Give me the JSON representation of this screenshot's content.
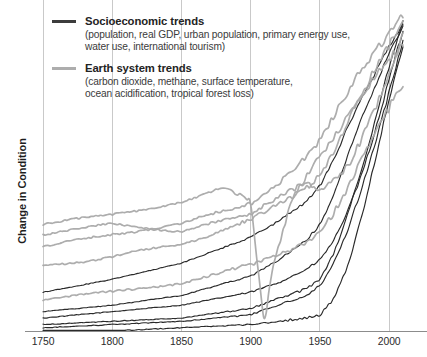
{
  "figure": {
    "title": "",
    "y_axis_label": "Change in Condition"
  },
  "legend": {
    "position": "top-left",
    "entries": [
      {
        "label": "Socioeconomic trends",
        "detail_line1": "(population, real GDP, urban population, primary energy use,",
        "detail_line2": "water use, international tourism)",
        "color": "#3c3c3c",
        "swatch_name": "socioeconomic-line-swatch"
      },
      {
        "label": "Earth system trends",
        "detail_line1": "(carbon dioxide, methane, surface temperature,",
        "detail_line2": "ocean acidification, tropical forest loss)",
        "color": "#adadad",
        "swatch_name": "earth-system-line-swatch"
      }
    ]
  },
  "axis": {
    "x_ticks": [
      "1750",
      "1800",
      "1850",
      "1900",
      "1950",
      "2000"
    ]
  },
  "colors": {
    "socioeconomic": "#2a2a2a",
    "earth_system": "#a9a9a9",
    "gridline": "#c9c9c9",
    "axis": "#8c8c8c",
    "background": "#ffffff"
  },
  "chart_data": {
    "type": "line",
    "title": "",
    "subtitle": "",
    "xlabel": "",
    "ylabel": "Change in Condition",
    "xlim": [
      1750,
      2010
    ],
    "ylim": [
      0,
      1
    ],
    "xticks": [
      1750,
      1800,
      1850,
      1900,
      1950,
      2000
    ],
    "yticks": [],
    "grid": "vertical-only",
    "legend_position": "top-left",
    "note": "The Great Acceleration: normalized indicators rising sharply after 1950. Y axis is unitless relative change; values are normalized 0-1 of plotted height.",
    "series": [
      {
        "name": "population",
        "group": "Socioeconomic trends",
        "color": "#2a2a2a",
        "x": [
          1750,
          1800,
          1850,
          1900,
          1920,
          1940,
          1950,
          1960,
          1970,
          1980,
          1990,
          2000,
          2010
        ],
        "values": [
          0.04,
          0.06,
          0.08,
          0.12,
          0.15,
          0.19,
          0.22,
          0.28,
          0.37,
          0.48,
          0.62,
          0.78,
          0.93
        ]
      },
      {
        "name": "real GDP",
        "group": "Socioeconomic trends",
        "color": "#2a2a2a",
        "x": [
          1750,
          1800,
          1850,
          1900,
          1920,
          1940,
          1950,
          1960,
          1970,
          1980,
          1990,
          2000,
          2010
        ],
        "values": [
          0.02,
          0.03,
          0.04,
          0.07,
          0.1,
          0.13,
          0.16,
          0.24,
          0.36,
          0.5,
          0.65,
          0.82,
          0.96
        ]
      },
      {
        "name": "urban population",
        "group": "Socioeconomic trends",
        "color": "#2a2a2a",
        "x": [
          1750,
          1800,
          1850,
          1900,
          1920,
          1940,
          1950,
          1960,
          1970,
          1980,
          1990,
          2000,
          2010
        ],
        "values": [
          0.01,
          0.02,
          0.03,
          0.05,
          0.08,
          0.11,
          0.14,
          0.21,
          0.31,
          0.44,
          0.58,
          0.74,
          0.9
        ]
      },
      {
        "name": "primary energy use",
        "group": "Socioeconomic trends",
        "color": "#2a2a2a",
        "x": [
          1750,
          1800,
          1850,
          1900,
          1920,
          1940,
          1950,
          1960,
          1970,
          1980,
          1990,
          2000,
          2010
        ],
        "values": [
          0.12,
          0.16,
          0.21,
          0.29,
          0.34,
          0.4,
          0.45,
          0.53,
          0.63,
          0.72,
          0.8,
          0.88,
          0.95
        ]
      },
      {
        "name": "water use",
        "group": "Socioeconomic trends",
        "color": "#2a2a2a",
        "x": [
          1750,
          1800,
          1850,
          1900,
          1920,
          1940,
          1950,
          1960,
          1970,
          1980,
          1990,
          2000,
          2010
        ],
        "values": [
          0.06,
          0.08,
          0.11,
          0.17,
          0.22,
          0.28,
          0.33,
          0.42,
          0.54,
          0.66,
          0.76,
          0.86,
          0.94
        ]
      },
      {
        "name": "international tourism",
        "group": "Socioeconomic trends",
        "color": "#2a2a2a",
        "x": [
          1750,
          1800,
          1850,
          1900,
          1920,
          1940,
          1950,
          1960,
          1970,
          1980,
          1990,
          2000,
          2010
        ],
        "values": [
          0.0,
          0.0,
          0.01,
          0.02,
          0.03,
          0.04,
          0.05,
          0.1,
          0.2,
          0.35,
          0.53,
          0.72,
          0.88
        ]
      },
      {
        "name": "carbon dioxide",
        "group": "Earth system trends",
        "color": "#a9a9a9",
        "x": [
          1750,
          1800,
          1850,
          1900,
          1920,
          1940,
          1950,
          1960,
          1970,
          1980,
          1990,
          2000,
          2010
        ],
        "values": [
          0.2,
          0.23,
          0.27,
          0.34,
          0.39,
          0.45,
          0.49,
          0.56,
          0.64,
          0.72,
          0.8,
          0.88,
          0.96
        ]
      },
      {
        "name": "methane",
        "group": "Earth system trends",
        "color": "#a9a9a9",
        "x": [
          1750,
          1800,
          1850,
          1900,
          1920,
          1940,
          1950,
          1960,
          1970,
          1980,
          1990,
          2000,
          2010
        ],
        "values": [
          0.26,
          0.3,
          0.33,
          0.4,
          0.46,
          0.53,
          0.58,
          0.66,
          0.74,
          0.82,
          0.88,
          0.93,
          0.98
        ]
      },
      {
        "name": "surface temperature",
        "group": "Earth system trends",
        "color": "#a9a9a9",
        "x": [
          1750,
          1800,
          1850,
          1900,
          1920,
          1940,
          1950,
          1960,
          1970,
          1980,
          1990,
          2000,
          2010
        ],
        "values": [
          0.3,
          0.33,
          0.31,
          0.36,
          0.42,
          0.47,
          0.44,
          0.46,
          0.5,
          0.58,
          0.68,
          0.8,
          0.92
        ]
      },
      {
        "name": "ocean acidification",
        "group": "Earth system trends",
        "color": "#a9a9a9",
        "x": [
          1750,
          1800,
          1850,
          1900,
          1920,
          1940,
          1950,
          1960,
          1970,
          1980,
          1990,
          2000,
          2010
        ],
        "values": [
          0.1,
          0.12,
          0.15,
          0.2,
          0.24,
          0.28,
          0.31,
          0.37,
          0.44,
          0.52,
          0.6,
          0.68,
          0.76
        ]
      },
      {
        "name": "tropical forest loss",
        "group": "Earth system trends",
        "color": "#a9a9a9",
        "x": [
          1750,
          1800,
          1850,
          1880,
          1900,
          1905,
          1910,
          1915,
          1930,
          1950,
          1970,
          1990,
          2010
        ],
        "values": [
          0.33,
          0.36,
          0.4,
          0.44,
          0.4,
          0.2,
          0.02,
          0.18,
          0.42,
          0.55,
          0.66,
          0.78,
          0.88
        ]
      }
    ]
  }
}
